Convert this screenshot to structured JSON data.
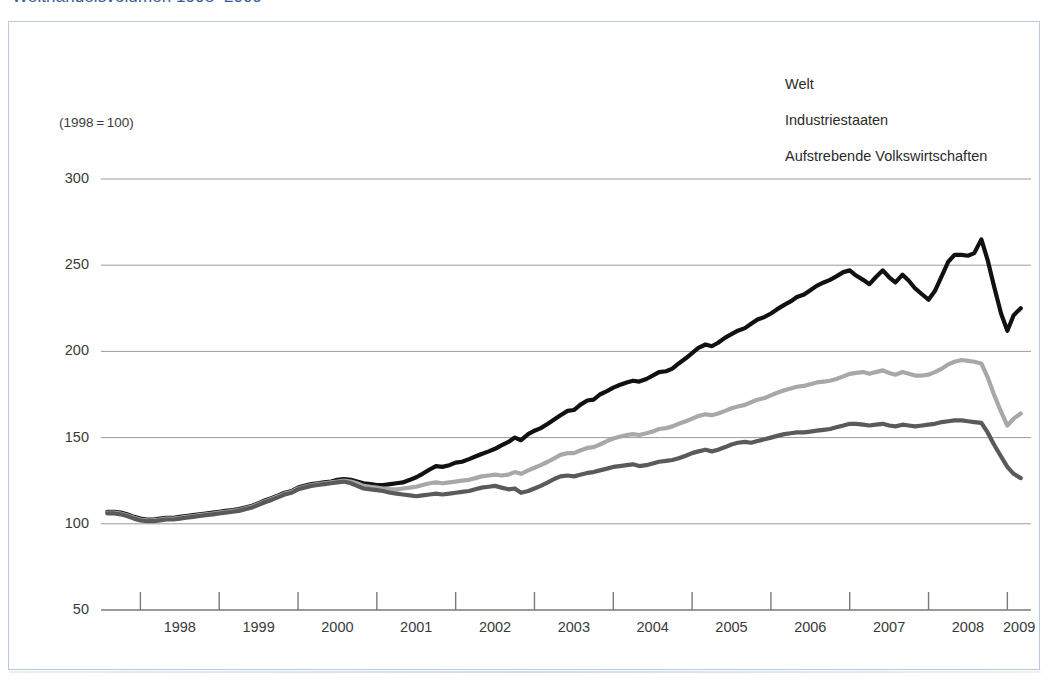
{
  "figure": {
    "title": "Welthandelsvolumen 1998–2009",
    "title_color": "#3a5a9b",
    "axis_note": "(1998 = 100)"
  },
  "legend": {
    "position": "top-right",
    "items": [
      {
        "label": "Welt",
        "color": "#a8a8a8"
      },
      {
        "label": "Industriestaaten",
        "color": "#5a5a5a"
      },
      {
        "label": "Aufstrebende Volkswirtschaften",
        "color": "#111111"
      }
    ]
  },
  "chart_data": {
    "type": "line",
    "title": "Welthandelsvolumen 1998–2009",
    "subtitle": "(1998 = 100)",
    "xlabel": "",
    "ylabel": "",
    "ylim": [
      50,
      300
    ],
    "yticks": [
      50,
      100,
      150,
      200,
      250,
      300
    ],
    "ytick_labels": [
      "50",
      "100",
      "150",
      "200",
      "250",
      "300"
    ],
    "grid": true,
    "grid_axis": "y",
    "xlim": [
      1997.5,
      2009.3
    ],
    "xticks": [
      1998,
      1999,
      2000,
      2001,
      2002,
      2003,
      2004,
      2005,
      2006,
      2007,
      2008,
      2009
    ],
    "xtick_labels": [
      "1998",
      "1999",
      "2000",
      "2001",
      "2002",
      "2003",
      "2004",
      "2005",
      "2006",
      "2007",
      "2008",
      "2009"
    ],
    "x": [
      1997.58,
      1997.67,
      1997.75,
      1997.83,
      1997.92,
      1998.0,
      1998.08,
      1998.17,
      1998.25,
      1998.33,
      1998.42,
      1998.5,
      1998.58,
      1998.67,
      1998.75,
      1998.83,
      1998.92,
      1999.0,
      1999.08,
      1999.17,
      1999.25,
      1999.33,
      1999.42,
      1999.5,
      1999.58,
      1999.67,
      1999.75,
      1999.83,
      1999.92,
      2000.0,
      2000.08,
      2000.17,
      2000.25,
      2000.33,
      2000.42,
      2000.5,
      2000.58,
      2000.67,
      2000.75,
      2000.83,
      2000.92,
      2001.0,
      2001.08,
      2001.17,
      2001.25,
      2001.33,
      2001.42,
      2001.5,
      2001.58,
      2001.67,
      2001.75,
      2001.83,
      2001.92,
      2002.0,
      2002.08,
      2002.17,
      2002.25,
      2002.33,
      2002.42,
      2002.5,
      2002.58,
      2002.67,
      2002.75,
      2002.83,
      2002.92,
      2003.0,
      2003.08,
      2003.17,
      2003.25,
      2003.33,
      2003.42,
      2003.5,
      2003.58,
      2003.67,
      2003.75,
      2003.83,
      2003.92,
      2004.0,
      2004.08,
      2004.17,
      2004.25,
      2004.33,
      2004.42,
      2004.5,
      2004.58,
      2004.67,
      2004.75,
      2004.83,
      2004.92,
      2005.0,
      2005.08,
      2005.17,
      2005.25,
      2005.33,
      2005.42,
      2005.5,
      2005.58,
      2005.67,
      2005.75,
      2005.83,
      2005.92,
      2006.0,
      2006.08,
      2006.17,
      2006.25,
      2006.33,
      2006.42,
      2006.5,
      2006.58,
      2006.67,
      2006.75,
      2006.83,
      2006.92,
      2007.0,
      2007.08,
      2007.17,
      2007.25,
      2007.33,
      2007.42,
      2007.5,
      2007.58,
      2007.67,
      2007.75,
      2007.83,
      2007.92,
      2008.0,
      2008.08,
      2008.17,
      2008.25,
      2008.33,
      2008.42,
      2008.5,
      2008.58,
      2008.67,
      2008.75,
      2008.83,
      2008.92,
      2009.0,
      2009.08,
      2009.17
    ],
    "series": [
      {
        "name": "Aufstrebende Volkswirtschaften",
        "color": "#111111",
        "width": 4.2,
        "values": [
          107,
          107,
          106.5,
          105.5,
          104,
          103,
          102.5,
          102.5,
          103,
          103.5,
          103.5,
          104,
          104.5,
          105,
          105.5,
          106,
          106.5,
          107,
          107.5,
          108,
          108.5,
          109.5,
          110.5,
          112,
          113.5,
          115,
          116.5,
          118,
          119,
          121,
          122,
          123,
          123.5,
          124,
          124.5,
          125.5,
          126,
          125.5,
          124.5,
          123.5,
          123,
          122.5,
          122.5,
          123,
          123.5,
          124,
          125.5,
          127,
          129,
          131.5,
          133.5,
          133,
          134,
          135.5,
          136,
          137.5,
          139,
          140.5,
          142,
          143.5,
          145.5,
          147.5,
          150,
          148.5,
          152,
          154,
          155.5,
          158,
          160.5,
          163,
          165.5,
          166,
          169,
          171.5,
          172,
          175,
          177,
          179,
          180.5,
          182,
          183,
          182.5,
          184,
          186,
          188,
          188.5,
          190,
          193,
          196,
          199,
          202,
          204,
          203,
          205,
          208,
          210,
          212,
          213.5,
          216,
          218.5,
          220,
          222,
          224.5,
          227,
          229,
          231.5,
          233,
          235.5,
          238,
          240,
          241.5,
          243.5,
          246,
          247,
          244,
          241.5,
          239,
          243,
          247,
          243,
          240,
          244.5,
          241,
          236.5,
          233,
          230,
          235,
          244,
          252,
          256,
          256,
          255.5,
          257,
          265,
          253,
          238,
          222,
          212,
          221,
          225
        ]
      },
      {
        "name": "Welt",
        "color": "#a8a8a8",
        "width": 4.2,
        "values": [
          106.5,
          106.5,
          106,
          105,
          103.5,
          102.5,
          102,
          102,
          102.5,
          103,
          103,
          103.5,
          104,
          104.5,
          105,
          105.5,
          106,
          106.5,
          107,
          107.5,
          108,
          109,
          110,
          111.5,
          113,
          114.5,
          116,
          117.5,
          118.5,
          120.5,
          121.5,
          122.5,
          123,
          123.5,
          124,
          124.5,
          125,
          124.5,
          123.5,
          122,
          121.5,
          121,
          120.5,
          120,
          120,
          120.5,
          121,
          121.5,
          122.5,
          123.5,
          124,
          123.5,
          124,
          124.5,
          125,
          125.5,
          126.5,
          127.5,
          128,
          128.5,
          128,
          128.5,
          130,
          129,
          131,
          132.5,
          134,
          136,
          138,
          140,
          141,
          141,
          142.5,
          144,
          144.5,
          146,
          148,
          149.5,
          150.5,
          151.5,
          152,
          151.5,
          152.5,
          153.5,
          155,
          155.5,
          156.5,
          158,
          159.5,
          161,
          162.5,
          163.5,
          163,
          164,
          165.5,
          167,
          168,
          169,
          170.5,
          172,
          173,
          174.5,
          176,
          177.5,
          178.5,
          179.5,
          180,
          181,
          182,
          182.5,
          183,
          184,
          185.5,
          187,
          187.5,
          188,
          187,
          188,
          189,
          187.5,
          186.5,
          188,
          187,
          186,
          186,
          186.5,
          188,
          190,
          192.5,
          194,
          195,
          194.5,
          194,
          193,
          185,
          175,
          165,
          157,
          161,
          164
        ]
      },
      {
        "name": "Industriestaaten",
        "color": "#5a5a5a",
        "width": 4.2,
        "values": [
          106,
          106,
          105.5,
          104.5,
          103,
          102,
          101.5,
          101.5,
          102,
          102.5,
          102.5,
          103,
          103.5,
          104,
          104.5,
          105,
          105.5,
          106,
          106.5,
          107,
          107.5,
          108.5,
          109.5,
          111,
          112.5,
          114,
          115.5,
          117,
          118,
          120,
          121,
          122,
          122.5,
          123,
          123.5,
          124,
          124.5,
          123.5,
          122,
          120.5,
          120,
          119.5,
          119,
          118,
          117.5,
          117,
          116.5,
          116,
          116.5,
          117,
          117.5,
          117,
          117.5,
          118,
          118.5,
          119,
          120,
          121,
          121.5,
          122,
          121,
          120,
          120.5,
          118,
          119,
          120.5,
          122,
          124,
          126,
          127.5,
          128,
          127.5,
          128.5,
          129.5,
          130,
          131,
          132,
          133,
          133.5,
          134,
          134.5,
          133.5,
          134,
          135,
          136,
          136.5,
          137,
          138,
          139.5,
          141,
          142,
          143,
          142,
          143,
          144.5,
          146,
          147,
          147.5,
          147,
          148,
          149,
          150,
          151,
          152,
          152.5,
          153,
          153,
          153.5,
          154,
          154.5,
          155,
          156,
          157,
          158,
          158,
          157.5,
          157,
          157.5,
          158,
          157,
          156.5,
          157.5,
          157,
          156.5,
          157,
          157.5,
          158,
          159,
          159.5,
          160,
          160,
          159.5,
          159,
          158.5,
          153,
          146,
          139,
          133,
          129,
          126.5
        ]
      }
    ],
    "annotations": [
      {
        "text": "peak emerging economies ≈ 265 (mid 2008)"
      },
      {
        "text": "trough emerging economies ≈ 212 (early 2009)"
      },
      {
        "text": "peak world ≈ 195 (mid 2008)"
      },
      {
        "text": "peak industrial ≈ 160 (mid 2008)"
      }
    ]
  }
}
